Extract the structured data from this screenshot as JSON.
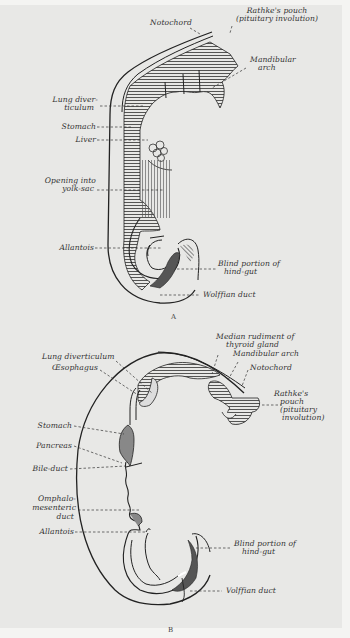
{
  "figure": {
    "type": "anatomical illustration",
    "panels": [
      {
        "id": "A",
        "caption": "A",
        "labels": [
          {
            "key": "notochord",
            "text": "Notochord"
          },
          {
            "key": "rathke_1",
            "text": "Rathke's pouch"
          },
          {
            "key": "rathke_2",
            "text": "(pituitary involution)"
          },
          {
            "key": "mandibular_1",
            "text": "Mandibular"
          },
          {
            "key": "mandibular_2",
            "text": "arch"
          },
          {
            "key": "lung_1",
            "text": "Lung diver-"
          },
          {
            "key": "lung_2",
            "text": "ticulum"
          },
          {
            "key": "stomach",
            "text": "Stomach"
          },
          {
            "key": "liver",
            "text": "Liver"
          },
          {
            "key": "yolk_1",
            "text": "Opening into"
          },
          {
            "key": "yolk_2",
            "text": "yolk-sac"
          },
          {
            "key": "allantois",
            "text": "Allantois"
          },
          {
            "key": "blind_1",
            "text": "Blind portion of"
          },
          {
            "key": "blind_2",
            "text": "hind-gut"
          },
          {
            "key": "wolffian",
            "text": "Wolffian duct"
          }
        ]
      },
      {
        "id": "B",
        "caption": "B",
        "labels": [
          {
            "key": "thyroid_1",
            "text": "Median rudiment of"
          },
          {
            "key": "thyroid_2",
            "text": "thyroid gland"
          },
          {
            "key": "mandibular",
            "text": "Mandibular arch"
          },
          {
            "key": "notochord",
            "text": "Notochord"
          },
          {
            "key": "lung",
            "text": "Lung diverticulum"
          },
          {
            "key": "oesophagus",
            "text": "Œsophagus"
          },
          {
            "key": "rathke_1",
            "text": "Rathke's"
          },
          {
            "key": "rathke_2",
            "text": "pouch"
          },
          {
            "key": "rathke_3",
            "text": "(pituitary"
          },
          {
            "key": "rathke_4",
            "text": "involution)"
          },
          {
            "key": "stomach",
            "text": "Stomach"
          },
          {
            "key": "pancreas",
            "text": "Pancreas"
          },
          {
            "key": "bile",
            "text": "Bile-duct"
          },
          {
            "key": "omph_1",
            "text": "Omphalo-"
          },
          {
            "key": "omph_2",
            "text": "mesenteric"
          },
          {
            "key": "omph_3",
            "text": "duct"
          },
          {
            "key": "allantois",
            "text": "Allantois"
          },
          {
            "key": "blind_1",
            "text": "Blind portion of"
          },
          {
            "key": "blind_2",
            "text": "hind-gut"
          },
          {
            "key": "wolffian",
            "text": "Wolffian duct"
          }
        ]
      }
    ]
  },
  "A": {
    "notochord": "Notochord",
    "rathke_1": "Rathke's pouch",
    "rathke_2": "(pituitary involution)",
    "mandibular_1": "Mandibular",
    "mandibular_2": "arch",
    "lung_1": "Lung diver-",
    "lung_2": "ticulum",
    "stomach": "Stomach",
    "liver": "Liver",
    "yolk_1": "Opening into",
    "yolk_2": "yolk-sac",
    "allantois": "Allantois",
    "blind_1": "Blind portion of",
    "blind_2": "hind-gut",
    "wolffian": "Wolffian duct",
    "caption": "A"
  },
  "B": {
    "thyroid_1": "Median rudiment of",
    "thyroid_2": "thyroid gland",
    "mandibular": "Mandibular arch",
    "notochord": "Notochord",
    "lung": "Lung diverticulum",
    "oesophagus": "Œsophagus",
    "rathke_1": "Rathke's",
    "rathke_2": "pouch",
    "rathke_3": "(pituitary",
    "rathke_4": "involution)",
    "stomach": "Stomach",
    "pancreas": "Pancreas",
    "bile": "Bile-duct",
    "omph_1": "Omphalo-",
    "omph_2": "mesenteric",
    "omph_3": "duct",
    "allantois": "Allantois",
    "blind_1": "Blind portion of",
    "blind_2": "hind-gut",
    "wolffian": "Volffian duct",
    "caption": "B"
  },
  "colors": {
    "paper": "#e8e8e6",
    "ink": "#222222",
    "shade": "#7a7a7a"
  }
}
